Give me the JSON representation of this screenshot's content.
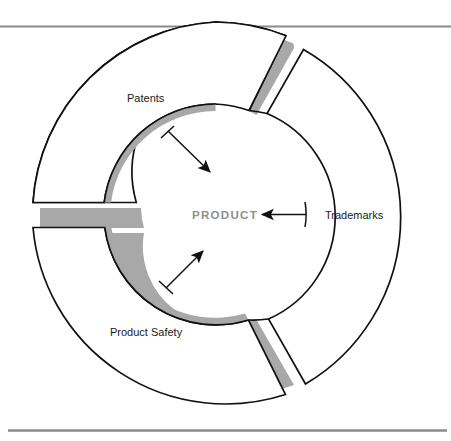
{
  "figure": {
    "title_visible": false,
    "center_label": "PRODUCT",
    "sectors": [
      {
        "id": "patents",
        "label": "Patents"
      },
      {
        "id": "trademarks",
        "label": "Trademarks"
      },
      {
        "id": "product-safety",
        "label": "Product Safety"
      }
    ],
    "colors": {
      "outline": "#111111",
      "shadow": "#a8a8a8",
      "fill": "#ffffff",
      "center_text": "#8e8e8e",
      "label_text": "#1a1a1a",
      "rule_line": "#8a8a8a",
      "background": "#ffffff"
    },
    "rules": {
      "top_rule": "horizontal rule near top of page",
      "bottom_rule": "horizontal rule near bottom of page"
    },
    "arrows": [
      {
        "id": "arrow-patents-inward",
        "from": "patents-inner-arc",
        "to": "product-center",
        "direction": "down-right"
      },
      {
        "id": "arrow-trademarks-inward",
        "from": "trademarks-inner-arc",
        "to": "product-center",
        "direction": "left"
      },
      {
        "id": "arrow-product-safety-inward",
        "from": "product-safety-inner-arc",
        "to": "product-center",
        "direction": "up-right"
      }
    ]
  }
}
